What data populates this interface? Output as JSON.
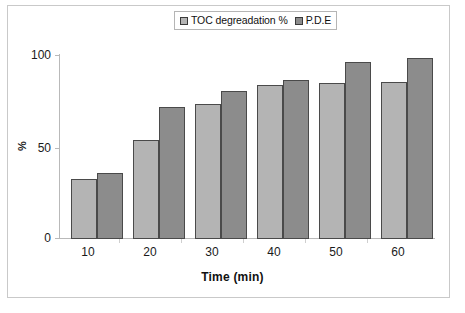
{
  "chart_data": {
    "type": "bar",
    "title": "",
    "subtitle": "",
    "xlabel": "Time (min)",
    "ylabel": "%",
    "categories": [
      "10",
      "20",
      "30",
      "40",
      "50",
      "60"
    ],
    "series": [
      {
        "name": "TOC degreadation %",
        "color": "#b4b4b4",
        "values": [
          33,
          54,
          74,
          84,
          85,
          86
        ]
      },
      {
        "name": "P.D.E",
        "color": "#8c8c8c",
        "values": [
          36,
          72,
          81,
          87,
          97,
          99
        ]
      }
    ],
    "ylim": [
      0,
      100
    ],
    "yticks": [
      "0",
      "50",
      "100"
    ],
    "grid": false,
    "legend_position": "top-center",
    "annotations": []
  },
  "legend": {
    "entries": [
      {
        "label": "TOC degreadation %",
        "swatch": "#b4b4b4"
      },
      {
        "label": "P.D.E",
        "swatch": "#8c8c8c"
      }
    ]
  },
  "axes": {
    "y_title": "%",
    "x_title": "Time (min)",
    "y_tick_labels": [
      "0",
      "50",
      "100"
    ],
    "x_tick_labels": [
      "10",
      "20",
      "30",
      "40",
      "50",
      "60"
    ]
  },
  "colors": {
    "series_1": "#b4b4b4",
    "series_2": "#8c8c8c",
    "bar_outline": "#4a4a4a",
    "axis": "#b9b9b9",
    "frame": "#c9c9c9",
    "background": "#ffffff"
  }
}
